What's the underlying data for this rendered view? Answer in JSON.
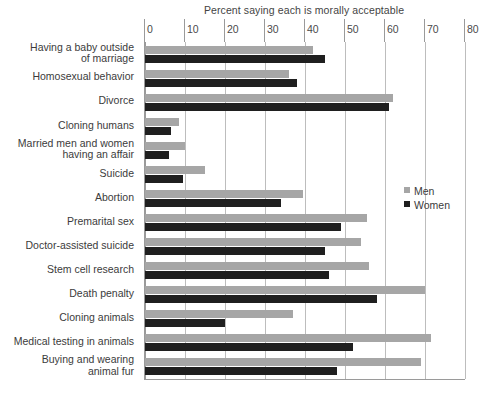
{
  "chart_data": {
    "type": "bar",
    "orientation": "horizontal",
    "title": "Percent saying each is morally acceptable",
    "xlabel": "",
    "ylabel": "",
    "xlim": [
      0,
      80
    ],
    "xticks": [
      0,
      10,
      20,
      30,
      40,
      50,
      60,
      70,
      80
    ],
    "grid": true,
    "legend_position": "right-middle",
    "categories": [
      "Having a baby outside\nof marriage",
      "Homosexual behavior",
      "Divorce",
      "Cloning humans",
      "Married men and women\nhaving an affair",
      "Suicide",
      "Abortion",
      "Premarital sex",
      "Doctor-assisted suicide",
      "Stem cell research",
      "Death penalty",
      "Cloning animals",
      "Medical testing in animals",
      "Buying and wearing\nanimal fur"
    ],
    "series": [
      {
        "name": "Men",
        "color": "#a6a6a6",
        "values": [
          42,
          36,
          62,
          8.5,
          10,
          15,
          39.5,
          55.5,
          54,
          56,
          70,
          37,
          71.5,
          69
        ]
      },
      {
        "name": "Women",
        "color": "#1f1f1f",
        "values": [
          45,
          38,
          61,
          6.5,
          6,
          9.5,
          34,
          49,
          45,
          46,
          58,
          20,
          52,
          48
        ]
      }
    ]
  },
  "legend": {
    "entries": [
      {
        "label": "Men",
        "color": "#a6a6a6"
      },
      {
        "label": "Women",
        "color": "#1f1f1f"
      }
    ]
  },
  "axis": {
    "tick_labels": [
      "0",
      "10",
      "20",
      "30",
      "40",
      "50",
      "60",
      "70",
      "80"
    ]
  }
}
